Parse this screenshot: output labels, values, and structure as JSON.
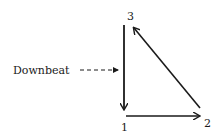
{
  "diagram": {
    "type": "conducting-pattern",
    "beats": [
      {
        "label": "1",
        "x": 124,
        "y": 131
      },
      {
        "label": "2",
        "x": 208,
        "y": 127
      },
      {
        "label": "3",
        "x": 130,
        "y": 20
      }
    ],
    "annotation": {
      "label": "Downbeat"
    },
    "arrows": [
      {
        "from": "3",
        "to": "1",
        "style": "solid"
      },
      {
        "from": "1",
        "to": "2",
        "style": "solid"
      },
      {
        "from": "2",
        "to": "3",
        "style": "solid"
      },
      {
        "from": "Downbeat",
        "to": "3-1 stroke",
        "style": "dashed"
      }
    ],
    "colors": {
      "stroke": "#1a1a1a",
      "background": "#ffffff"
    }
  }
}
